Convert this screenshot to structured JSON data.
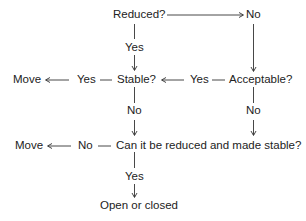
{
  "diagram": {
    "type": "flowchart",
    "nodes": {
      "reduced": {
        "label": "Reduced?"
      },
      "reduced_no": {
        "label": "No"
      },
      "reduced_yes": {
        "label": "Yes"
      },
      "stable": {
        "label": "Stable?"
      },
      "stable_yes": {
        "label": "Yes"
      },
      "stable_yes_move": {
        "label": "Move"
      },
      "stable_no": {
        "label": "No"
      },
      "acceptable": {
        "label": "Acceptable?"
      },
      "acceptable_yes": {
        "label": "Yes"
      },
      "acceptable_no": {
        "label": "No"
      },
      "can_reduce": {
        "label": "Can it be reduced and made stable?"
      },
      "can_reduce_no": {
        "label": "No"
      },
      "can_reduce_no_move": {
        "label": "Move"
      },
      "can_reduce_yes": {
        "label": "Yes"
      },
      "open_closed": {
        "label": "Open or closed"
      }
    },
    "edges": [
      {
        "from": "Reduced?",
        "to": "No",
        "direction": "right"
      },
      {
        "from": "Reduced?",
        "via": "Yes",
        "to": "Stable?",
        "direction": "down"
      },
      {
        "from": "No",
        "to": "Acceptable?",
        "direction": "down"
      },
      {
        "from": "Acceptable?",
        "via": "Yes",
        "to": "Stable?",
        "direction": "left"
      },
      {
        "from": "Stable?",
        "via": "Yes",
        "to": "Move",
        "direction": "left"
      },
      {
        "from": "Stable?",
        "via": "No",
        "to": "Can it be reduced and made stable?",
        "direction": "down"
      },
      {
        "from": "Acceptable?",
        "via": "No",
        "to": "Can it be reduced and made stable?",
        "direction": "down"
      },
      {
        "from": "Can it be reduced and made stable?",
        "via": "No",
        "to": "Move",
        "direction": "left"
      },
      {
        "from": "Can it be reduced and made stable?",
        "via": "Yes",
        "to": "Open or closed",
        "direction": "down"
      }
    ],
    "colors": {
      "text": "#222222",
      "line": "#333333",
      "background": "#ffffff"
    }
  }
}
